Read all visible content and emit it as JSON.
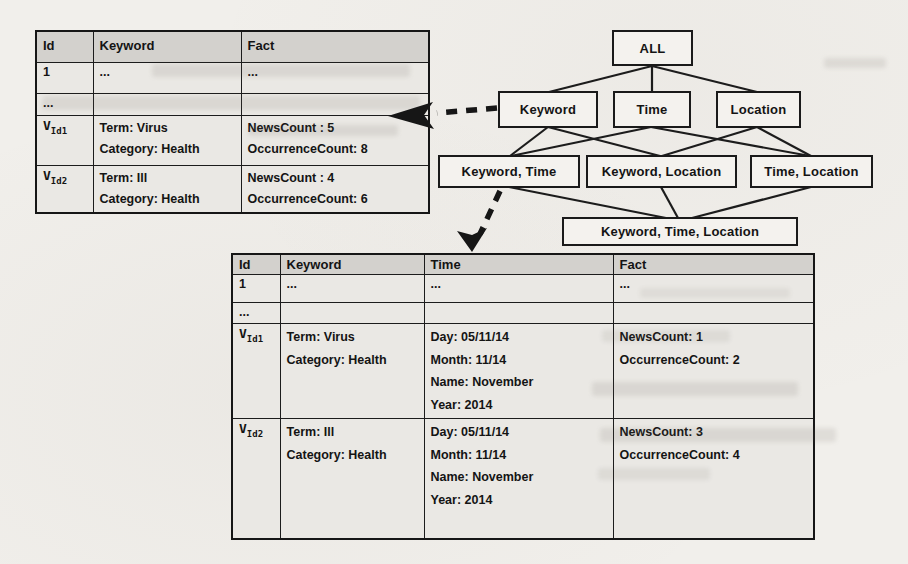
{
  "figure": {
    "description_note": "",
    "colors": {
      "page_bg": "#f1efeb",
      "table_header_bg": "#d3d1cd",
      "table_body_bg": "#eae8e4",
      "border": "#1a1a1a",
      "text": "#141414"
    }
  },
  "lattice": {
    "nodes": [
      {
        "id": "all",
        "label": "ALL"
      },
      {
        "id": "keyword",
        "label": "Keyword"
      },
      {
        "id": "time",
        "label": "Time"
      },
      {
        "id": "location",
        "label": "Location"
      },
      {
        "id": "keyword-time",
        "label": "Keyword, Time"
      },
      {
        "id": "keyword-location",
        "label": "Keyword, Location"
      },
      {
        "id": "time-location",
        "label": "Time, Location"
      },
      {
        "id": "keyword-time-location",
        "label": "Keyword, Time, Location"
      }
    ]
  },
  "keyword_table": {
    "headers": [
      "Id",
      "Keyword",
      "Fact"
    ],
    "rows": [
      {
        "id": {
          "text": "1"
        },
        "keyword": [
          "..."
        ],
        "fact": [
          "..."
        ]
      },
      {
        "id": {
          "text": "..."
        },
        "keyword": [],
        "fact": []
      },
      {
        "id": {
          "base": "V",
          "sub": "Id1"
        },
        "keyword": [
          "Term: Virus",
          "Category: Health"
        ],
        "fact": [
          "NewsCount : 5",
          "OccurrenceCount: 8"
        ]
      },
      {
        "id": {
          "base": "V",
          "sub": "Id2"
        },
        "keyword": [
          "Term: Ill",
          "Category: Health"
        ],
        "fact": [
          "NewsCount : 4",
          "OccurrenceCount: 6"
        ]
      }
    ]
  },
  "keyword_time_table": {
    "headers": [
      "Id",
      "Keyword",
      "Time",
      "Fact"
    ],
    "rows": [
      {
        "id": {
          "text": "1"
        },
        "keyword": [
          "..."
        ],
        "time": [
          "..."
        ],
        "fact": [
          "..."
        ]
      },
      {
        "id": {
          "text": "..."
        },
        "keyword": [],
        "time": [],
        "fact": []
      },
      {
        "id": {
          "base": "V",
          "sub": "Id1"
        },
        "keyword": [
          "Term: Virus",
          "Category: Health"
        ],
        "time": [
          "Day: 05/11/14",
          "Month: 11/14",
          "Name: November",
          "Year: 2014"
        ],
        "fact": [
          "NewsCount: 1",
          "OccurrenceCount: 2"
        ]
      },
      {
        "id": {
          "base": "V",
          "sub": "Id2"
        },
        "keyword": [
          "Term: Ill",
          "Category: Health"
        ],
        "time": [
          "Day: 05/11/14",
          "Month: 11/14",
          "Name: November",
          "Year: 2014"
        ],
        "fact": [
          "NewsCount: 3",
          "OccurrenceCount: 4"
        ]
      }
    ]
  }
}
